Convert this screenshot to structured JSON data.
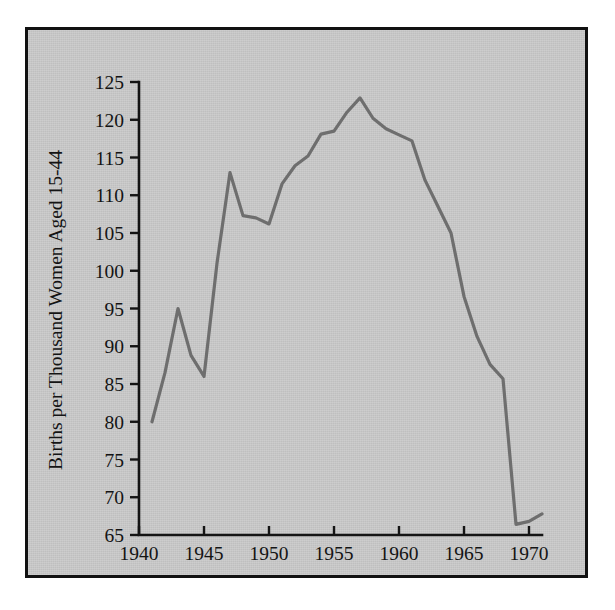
{
  "figure": {
    "panel_background": "#c9c9c9",
    "border_color": "#111111",
    "page_background": "#ffffff"
  },
  "chart_data": {
    "type": "line",
    "title": "",
    "xlabel": "",
    "ylabel": "Births per Thousand Women Aged 15-44",
    "xlim": [
      1940,
      1971
    ],
    "ylim": [
      65,
      125
    ],
    "grid": false,
    "legend": null,
    "line_color": "#6e6e6e",
    "xticks": [
      1940,
      1945,
      1950,
      1955,
      1960,
      1965,
      1970
    ],
    "xtick_labels": [
      "1940",
      "1945",
      "1950",
      "1955",
      "1960",
      "1965",
      "1970"
    ],
    "yticks": [
      65,
      70,
      75,
      80,
      85,
      90,
      95,
      100,
      105,
      110,
      115,
      120,
      125
    ],
    "ytick_labels": [
      "65",
      "70",
      "75",
      "80",
      "85",
      "90",
      "95",
      "100",
      "105",
      "110",
      "115",
      "120",
      "125"
    ],
    "x": [
      1941,
      1942,
      1943,
      1944,
      1945,
      1946,
      1947,
      1948,
      1949,
      1950,
      1951,
      1952,
      1953,
      1954,
      1955,
      1956,
      1957,
      1958,
      1959,
      1960,
      1961,
      1962,
      1963,
      1964,
      1965,
      1966,
      1967,
      1968,
      1969,
      1970,
      1971
    ],
    "values": [
      80.0,
      86.5,
      95.0,
      88.8,
      86.0,
      101.0,
      113.0,
      107.3,
      107.0,
      106.2,
      111.5,
      113.9,
      115.2,
      118.1,
      118.5,
      121.0,
      122.9,
      120.2,
      118.8,
      118.0,
      117.2,
      112.0,
      108.5,
      105.0,
      96.6,
      91.3,
      87.6,
      85.7,
      66.4,
      66.8,
      67.8
    ]
  },
  "annotations": {
    "peak_year": "1957",
    "peak_value": "122.9"
  }
}
